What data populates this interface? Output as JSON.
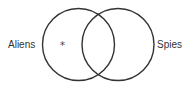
{
  "diagram": {
    "type": "venn",
    "sets": [
      {
        "label": "Aliens",
        "cx": 78.5,
        "cy": 44.5,
        "r": 36
      },
      {
        "label": "Spies",
        "cx": 118,
        "cy": 44.5,
        "r": 36
      }
    ],
    "marker": {
      "symbol": "*",
      "region": "Aliens only"
    },
    "stroke_color": "#333333"
  }
}
